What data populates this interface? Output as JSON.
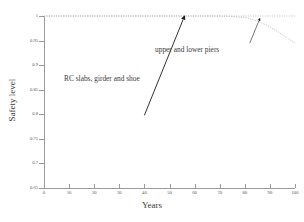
{
  "chart_data": {
    "type": "line",
    "title": "",
    "xlabel": "Years",
    "ylabel": "Safety level",
    "xlim": [
      0,
      100
    ],
    "ylim": [
      0.65,
      1.0
    ],
    "grid": false,
    "legend": "none",
    "line_style": "dotted",
    "line_color": "#b0b0b0",
    "xticks": [
      0,
      10,
      20,
      30,
      40,
      50,
      60,
      70,
      80,
      90,
      100
    ],
    "xtick_labels": [
      "0",
      "10",
      "20",
      "30",
      "40",
      "50",
      "60",
      "70",
      "80",
      "90",
      "100"
    ],
    "yticks": [
      0.65,
      0.7,
      0.75,
      0.8,
      0.85,
      0.9,
      0.95,
      1
    ],
    "ytick_labels": [
      "0.65",
      "0.7",
      "0.75",
      "0.8",
      "0.85",
      "0.9",
      "0.95",
      "1"
    ],
    "series": [
      {
        "name": "RC slabs, girder and shoe",
        "x": [
          0,
          10,
          20,
          30,
          40,
          50,
          60,
          70,
          80,
          90,
          100
        ],
        "values": [
          1,
          1,
          1,
          1,
          1,
          1,
          1,
          1,
          1,
          1,
          1
        ]
      },
      {
        "name": "upper and lower piers",
        "x": [
          0,
          10,
          20,
          30,
          40,
          50,
          60,
          70,
          75,
          80,
          85,
          90,
          95,
          100
        ],
        "values": [
          1,
          1,
          1,
          1,
          1,
          1,
          1,
          1,
          0.999,
          0.997,
          0.99,
          0.978,
          0.962,
          0.945
        ]
      }
    ],
    "annotations": [
      {
        "text": "RC slabs, girder and shoe",
        "arrow_from": [
          40,
          0.798
        ],
        "arrow_to": [
          56,
          1.0
        ]
      },
      {
        "text": "upper and lower piers",
        "arrow_from": [
          82,
          0.945
        ],
        "arrow_to": [
          86,
          0.995
        ]
      }
    ]
  }
}
